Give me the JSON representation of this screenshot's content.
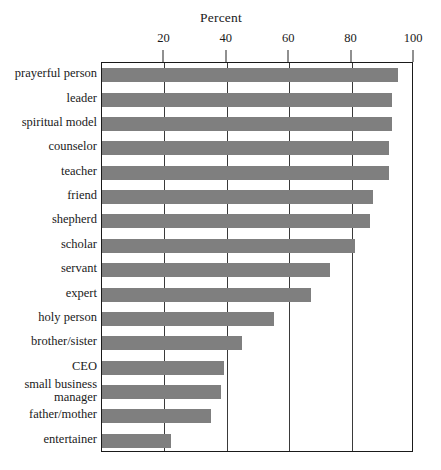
{
  "chart_data": {
    "type": "bar",
    "orientation": "horizontal",
    "title": "Percent",
    "xlabel": "",
    "ylabel": "",
    "xlim": [
      0,
      100
    ],
    "xticks": [
      20,
      40,
      60,
      80,
      100
    ],
    "xtick_labels": [
      "20",
      "40",
      "60",
      "80",
      "100"
    ],
    "grid": "vertical",
    "legend": "none",
    "bar_color": "#7f7f7f",
    "frame_color": "#1a1a1a",
    "background": "#ffffff",
    "categories": [
      "prayerful person",
      "leader",
      "spiritual model",
      "counselor",
      "teacher",
      "friend",
      "shepherd",
      "scholar",
      "servant",
      "expert",
      "holy person",
      "brother/sister",
      "CEO",
      "small business\nmanager",
      "father/mother",
      "entertainer"
    ],
    "values": [
      95,
      93,
      93,
      92,
      92,
      87,
      86,
      81,
      73,
      67,
      55,
      45,
      39,
      38,
      35,
      22
    ]
  }
}
